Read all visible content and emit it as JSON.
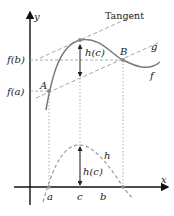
{
  "diagram": {
    "axes": {
      "x_label": "x",
      "y_label": "y"
    },
    "y_ticks": {
      "fb": "f(b)",
      "fa": "f(a)"
    },
    "x_ticks": {
      "a": "a",
      "c": "c",
      "b": "b"
    },
    "points": {
      "A": "A",
      "B": "B"
    },
    "curves": {
      "f": "f",
      "g": "g",
      "h": "h"
    },
    "annotations": {
      "tangent": "Tangent",
      "hc_top": "h(c)",
      "hc_bottom": "h(c)"
    },
    "colors": {
      "curve": "#7a7a7a",
      "dashed": "#9a9a9a",
      "axis": "#111111",
      "point": "#8a8a8a"
    }
  }
}
